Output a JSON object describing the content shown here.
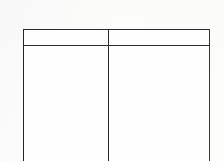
{
  "document": {
    "kind": "scanned-table-fragment",
    "page_background_color": "#fdfdfc",
    "rule_color": "#2b2b2d",
    "cell_background_color": "#fefefe",
    "note": "blank two-column table, bottom edge cropped by the page boundary"
  },
  "table": {
    "column_count": 2,
    "row_count": 2,
    "has_top_rule": true,
    "has_header_rule": true,
    "has_bottom_rule": false,
    "columns": [
      {
        "id": "column-1",
        "header": "",
        "width_px": 84
      },
      {
        "id": "column-2",
        "header": "",
        "width_px": 100
      }
    ],
    "header_row": {
      "id": "header-row",
      "cells": [
        "",
        ""
      ]
    },
    "body_rows": [
      {
        "id": "body-row-1",
        "cells": [
          "",
          ""
        ]
      }
    ]
  }
}
